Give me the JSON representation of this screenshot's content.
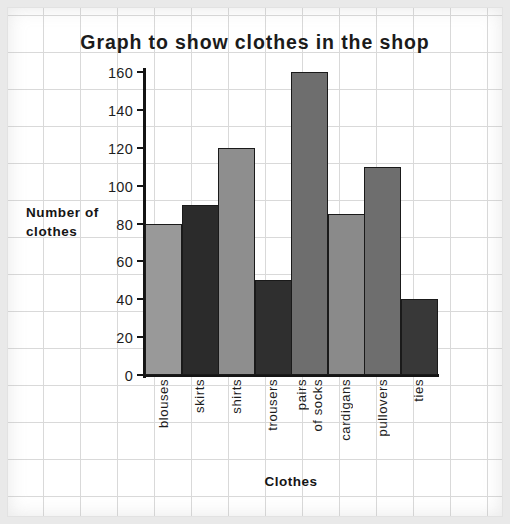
{
  "chart_data": {
    "type": "bar",
    "title": "Graph to show clothes in the shop",
    "xlabel": "Clothes",
    "ylabel": "Number of clothes",
    "ylabel_lines": [
      "Number of",
      "clothes"
    ],
    "categories": [
      "blouses",
      "skirts",
      "shirts",
      "trousers",
      "pairs of socks",
      "cardigans",
      "pullovers",
      "ties"
    ],
    "category_label_lines": [
      [
        "blouses"
      ],
      [
        "skirts"
      ],
      [
        "shirts"
      ],
      [
        "trousers"
      ],
      [
        "pairs",
        "of socks"
      ],
      [
        "cardigans"
      ],
      [
        "pullovers"
      ],
      [
        "ties"
      ]
    ],
    "values": [
      80,
      90,
      120,
      50,
      160,
      85,
      110,
      40
    ],
    "bar_colors": [
      "#999999",
      "#2b2b2b",
      "#8e8e8e",
      "#2f2f2f",
      "#6e6e6e",
      "#8a8a8a",
      "#6e6e6e",
      "#383838"
    ],
    "bar_border_color": "#1a1a1a",
    "ylim": [
      0,
      160
    ],
    "yticks": [
      0,
      20,
      40,
      60,
      80,
      100,
      120,
      140,
      160
    ],
    "ytick_labels": [
      "0",
      "20",
      "40",
      "60",
      "80",
      "100",
      "120",
      "140",
      "160"
    ],
    "grid": true,
    "grid_style": "graph-paper",
    "grid_color": "#d9d9d9",
    "legend": false,
    "background_color": "#ffffff",
    "page_color": "#e9e9e9"
  }
}
